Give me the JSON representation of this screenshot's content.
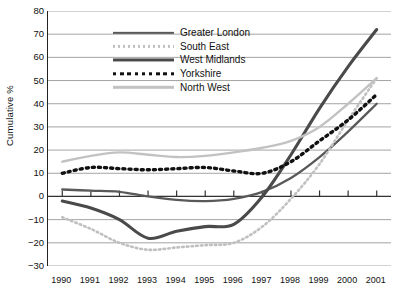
{
  "chart_data": {
    "type": "line",
    "title": "",
    "xlabel": "",
    "ylabel": "Cumulative %",
    "ylim": [
      -30,
      80
    ],
    "ytick_step": 10,
    "grid": true,
    "legend_position": "inside-top-left",
    "x": [
      "1990",
      "1991",
      "1992",
      "1993",
      "1994",
      "1995",
      "1996",
      "1997",
      "1998",
      "1999",
      "2000",
      "2001"
    ],
    "ytick_labels": [
      "80",
      "70",
      "60",
      "50",
      "40",
      "30",
      "20",
      "10",
      "0",
      "-10",
      "-20",
      "-30"
    ],
    "series": [
      {
        "name": "Greater London",
        "color": "#595959",
        "style": "solid",
        "width": 2.3,
        "values": [
          3,
          2.5,
          2,
          0,
          -1.5,
          -2,
          -1,
          2,
          8,
          17,
          28,
          40
        ]
      },
      {
        "name": "South East",
        "color": "#c0c0c0",
        "style": "dotted",
        "width": 2.6,
        "values": [
          -9,
          -14,
          -20,
          -23,
          -22,
          -21,
          -20,
          -13,
          -1,
          14,
          33,
          51
        ]
      },
      {
        "name": "West Midlands",
        "color": "#4a4a4a",
        "style": "solid",
        "width": 3.1,
        "values": [
          -2,
          -5,
          -10,
          -18,
          -15,
          -13,
          -12,
          0,
          18,
          38,
          56,
          72
        ]
      },
      {
        "name": "Yorkshire",
        "color": "#111111",
        "style": "dotted",
        "width": 3.4,
        "values": [
          10,
          12.5,
          12,
          11.5,
          12,
          12.5,
          11,
          10,
          15,
          24,
          33,
          44
        ]
      },
      {
        "name": "North West",
        "color": "#c2c2c2",
        "style": "solid",
        "width": 2.4,
        "values": [
          15,
          17.5,
          19,
          18,
          17,
          17.5,
          19,
          21,
          24,
          30,
          40,
          51
        ]
      }
    ]
  }
}
